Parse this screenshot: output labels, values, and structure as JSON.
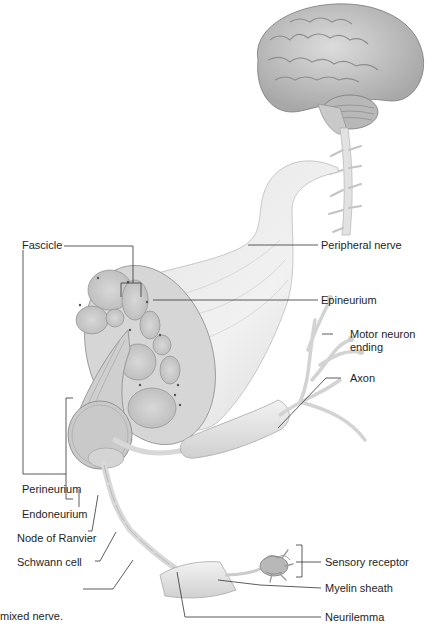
{
  "figure": {
    "caption_fragment": "mixed nerve.",
    "labels": {
      "fascicle": "Fascicle",
      "peripheral_nerve": "Peripheral nerve",
      "epineurium": "Epineurium",
      "motor_neuron_ending_line1": "Motor neuron",
      "motor_neuron_ending_line2": "ending",
      "axon": "Axon",
      "perineurium": "Perineurium",
      "endoneurium": "Endoneurium",
      "node_of_ranvier": "Node of Ranvier",
      "schwann_cell": "Schwann cell",
      "sensory_receptor": "Sensory receptor",
      "myelin_sheath": "Myelin sheath",
      "neurilemma": "Neurilemma"
    },
    "structures": [
      "brain",
      "spinal-cord",
      "peripheral-nerve",
      "nerve-cross-section",
      "fascicle",
      "neuron-axon",
      "motor-neuron-ending",
      "schwann-cells",
      "sensory-receptor"
    ],
    "colors": {
      "leader_line": "#333333",
      "tissue_light": "#e6e6e6",
      "tissue_mid": "#c8c8c8",
      "tissue_dark": "#8a8a8a"
    }
  }
}
